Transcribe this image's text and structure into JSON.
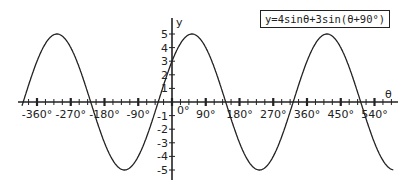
{
  "chart_data": {
    "type": "line",
    "title": "y=4sinθ+3sin(θ+90°)",
    "xlabel": "θ",
    "ylabel": "y",
    "equation": {
      "a": 4,
      "b": 3,
      "phase_deg": 90
    },
    "xlim": [
      -400,
      600
    ],
    "ylim": [
      -5,
      5
    ],
    "x_ticks": [
      -360,
      -270,
      -180,
      -90,
      0,
      90,
      180,
      270,
      360,
      450,
      540
    ],
    "x_tick_labels": [
      "-360°",
      "-270°",
      "-180°",
      "-90°",
      "0°",
      "90°",
      "180°",
      "270°",
      "360°",
      "450°",
      "540°"
    ],
    "y_ticks": [
      -5,
      -4,
      -3,
      -2,
      -1,
      1,
      2,
      3,
      4,
      5
    ],
    "y_tick_labels": [
      "-5",
      "-4",
      "-3",
      "-2",
      "-1",
      "1",
      "2",
      "3",
      "4",
      "5"
    ],
    "grid": false,
    "series": [
      {
        "name": "y=4sinθ+3sin(θ+90°)",
        "x": [
          -400,
          -360,
          -306.87,
          -270,
          -216.87,
          -180,
          -126.87,
          -90,
          -36.87,
          0,
          53.13,
          90,
          143.13,
          180,
          233.13,
          270,
          323.13,
          360,
          413.13,
          450,
          503.13,
          540,
          590
        ],
        "values": [
          0.83,
          3,
          5,
          4,
          0,
          -3,
          -5,
          -4,
          0,
          3,
          5,
          4,
          0,
          -3,
          -5,
          -4,
          0,
          3,
          5,
          4,
          0,
          -3,
          -4.9
        ]
      }
    ]
  },
  "labels": {
    "title": "y=4sinθ+3sin(θ+90°)",
    "x_axis": "θ",
    "y_axis": "y"
  }
}
